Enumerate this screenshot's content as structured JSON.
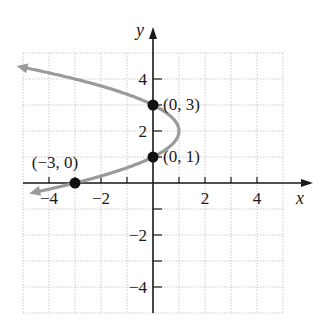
{
  "chart_data": {
    "type": "line",
    "title": "",
    "xlabel": "x",
    "ylabel": "y",
    "xlim": [
      -5,
      5
    ],
    "ylim": [
      -5,
      5
    ],
    "grid": true,
    "x_ticks": [
      -4,
      -2,
      2,
      4
    ],
    "y_ticks": [
      4,
      2,
      -2,
      -4
    ],
    "x_tick_labels": [
      "−4",
      "−2",
      "2",
      "4"
    ],
    "y_tick_labels": [
      "4",
      "2",
      "−2",
      "−4"
    ],
    "series": [
      {
        "name": "x = -(y-1)(y-3)",
        "equation": "x = -y^2 + 4y - 3",
        "color": "#9a9a9a",
        "vertex": [
          1,
          2
        ],
        "arrows": "both ends"
      }
    ],
    "points": [
      {
        "x": 0,
        "y": 3,
        "label": "(0, 3)"
      },
      {
        "x": 0,
        "y": 1,
        "label": "(0, 1)"
      },
      {
        "x": -3,
        "y": 0,
        "label": "(−3, 0)"
      }
    ]
  },
  "colors": {
    "axis": "#1a1a1a",
    "grid": "#bdbdbd",
    "curve": "#9a9a9a",
    "point": "#111111"
  }
}
